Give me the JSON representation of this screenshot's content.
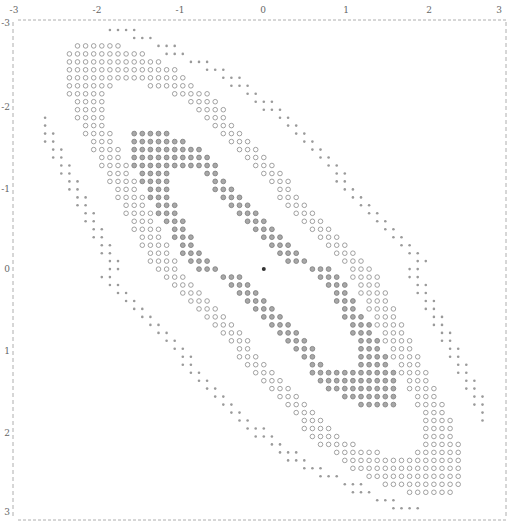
{
  "chart_data": {
    "type": "scatter",
    "title": "",
    "xlabel": "",
    "ylabel": "",
    "xlim": [
      -3,
      3
    ],
    "ylim": [
      -3,
      3
    ],
    "x_ticks": [
      "-3",
      "-2",
      "-1",
      "0",
      "1",
      "2",
      "3"
    ],
    "y_ticks": [
      "-3",
      "-2",
      "-1",
      "0",
      "1",
      "2",
      "3"
    ],
    "x_axis_position": "top",
    "y_axis_inverted": true,
    "grid": false,
    "frame": "dashed",
    "symmetry": "point-symmetric about (0,0)",
    "lattice": {
      "cols": 57,
      "rows": 61,
      "center_col": 28,
      "center_row": 30
    },
    "markers": {
      "dot": {
        "label": "small dot",
        "color": "#9a9a9a"
      },
      "ring": {
        "label": "hollow circle",
        "color": "#8a8a8a"
      },
      "filled": {
        "label": "filled circle",
        "color": "#7a7a7a"
      },
      "center": {
        "label": "center point",
        "color": "#333333"
      }
    },
    "rows_upper_half": [
      {
        "r": 0,
        "runs": [
          [
            "dot",
            9,
            12
          ]
        ]
      },
      {
        "r": 1,
        "runs": [
          [
            "dot",
            12,
            14
          ]
        ]
      },
      {
        "r": 2,
        "runs": [
          [
            "ring",
            5,
            10
          ],
          [
            "dot",
            15,
            17
          ]
        ]
      },
      {
        "r": 3,
        "runs": [
          [
            "ring",
            4,
            13
          ],
          [
            "dot",
            16,
            18
          ]
        ]
      },
      {
        "r": 4,
        "runs": [
          [
            "ring",
            4,
            15
          ],
          [
            "dot",
            19,
            21
          ]
        ]
      },
      {
        "r": 5,
        "runs": [
          [
            "ring",
            4,
            17
          ],
          [
            "dot",
            21,
            23
          ]
        ]
      },
      {
        "r": 6,
        "runs": [
          [
            "ring",
            4,
            18
          ],
          [
            "dot",
            23,
            25
          ]
        ]
      },
      {
        "r": 7,
        "runs": [
          [
            "ring",
            4,
            9
          ],
          [
            "ring",
            14,
            19
          ],
          [
            "dot",
            24,
            26
          ]
        ]
      },
      {
        "r": 8,
        "runs": [
          [
            "ring",
            4,
            8
          ],
          [
            "ring",
            17,
            21
          ],
          [
            "dot",
            26,
            27
          ]
        ]
      },
      {
        "r": 9,
        "runs": [
          [
            "ring",
            5,
            8
          ],
          [
            "ring",
            19,
            22
          ],
          [
            "dot",
            27,
            29
          ]
        ]
      },
      {
        "r": 10,
        "runs": [
          [
            "ring",
            5,
            8
          ],
          [
            "ring",
            20,
            23
          ],
          [
            "dot",
            28,
            30
          ]
        ]
      },
      {
        "r": 11,
        "runs": [
          [
            "ring",
            5,
            8
          ],
          [
            "dot",
            1,
            1
          ],
          [
            "ring",
            21,
            23
          ],
          [
            "dot",
            30,
            31
          ]
        ]
      },
      {
        "r": 12,
        "runs": [
          [
            "dot",
            1,
            1
          ],
          [
            "ring",
            6,
            8
          ],
          [
            "ring",
            22,
            24
          ],
          [
            "dot",
            31,
            32
          ]
        ]
      },
      {
        "r": 13,
        "runs": [
          [
            "dot",
            1,
            2
          ],
          [
            "ring",
            6,
            9
          ],
          [
            "filled",
            12,
            16
          ],
          [
            "ring",
            23,
            25
          ],
          [
            "dot",
            32,
            33
          ]
        ]
      },
      {
        "r": 14,
        "runs": [
          [
            "dot",
            1,
            2
          ],
          [
            "ring",
            7,
            9
          ],
          [
            "filled",
            12,
            18
          ],
          [
            "ring",
            24,
            26
          ],
          [
            "dot",
            33,
            34
          ]
        ]
      },
      {
        "r": 15,
        "runs": [
          [
            "dot",
            2,
            3
          ],
          [
            "ring",
            7,
            10
          ],
          [
            "filled",
            12,
            20
          ],
          [
            "ring",
            25,
            27
          ],
          [
            "dot",
            34,
            35
          ]
        ]
      },
      {
        "r": 16,
        "runs": [
          [
            "dot",
            2,
            3
          ],
          [
            "ring",
            8,
            10
          ],
          [
            "filled",
            12,
            21
          ],
          [
            "ring",
            26,
            28
          ],
          [
            "dot",
            35,
            36
          ]
        ]
      },
      {
        "r": 17,
        "runs": [
          [
            "dot",
            3,
            4
          ],
          [
            "ring",
            8,
            11
          ],
          [
            "filled",
            12,
            22
          ],
          [
            "ring",
            27,
            29
          ],
          [
            "dot",
            36,
            37
          ]
        ]
      },
      {
        "r": 18,
        "runs": [
          [
            "dot",
            3,
            4
          ],
          [
            "ring",
            9,
            11
          ],
          [
            "filled",
            13,
            16
          ],
          [
            "filled",
            21,
            22
          ],
          [
            "ring",
            28,
            30
          ],
          [
            "dot",
            37,
            38
          ]
        ]
      },
      {
        "r": 19,
        "runs": [
          [
            "dot",
            4,
            5
          ],
          [
            "ring",
            9,
            12
          ],
          [
            "filled",
            13,
            16
          ],
          [
            "filled",
            22,
            23
          ],
          [
            "ring",
            29,
            31
          ],
          [
            "dot",
            37,
            38
          ]
        ]
      },
      {
        "r": 20,
        "runs": [
          [
            "dot",
            4,
            5
          ],
          [
            "ring",
            10,
            12
          ],
          [
            "filled",
            14,
            16
          ],
          [
            "filled",
            22,
            24
          ],
          [
            "ring",
            30,
            31
          ],
          [
            "dot",
            38,
            39
          ]
        ]
      },
      {
        "r": 21,
        "runs": [
          [
            "dot",
            5,
            6
          ],
          [
            "ring",
            10,
            13
          ],
          [
            "filled",
            14,
            16
          ],
          [
            "filled",
            23,
            25
          ],
          [
            "ring",
            30,
            32
          ],
          [
            "dot",
            39,
            40
          ]
        ]
      },
      {
        "r": 22,
        "runs": [
          [
            "dot",
            5,
            6
          ],
          [
            "ring",
            11,
            13
          ],
          [
            "filled",
            15,
            17
          ],
          [
            "filled",
            24,
            26
          ],
          [
            "ring",
            31,
            33
          ],
          [
            "dot",
            40,
            41
          ]
        ]
      },
      {
        "r": 23,
        "runs": [
          [
            "dot",
            6,
            7
          ],
          [
            "ring",
            11,
            14
          ],
          [
            "filled",
            15,
            17
          ],
          [
            "filled",
            25,
            27
          ],
          [
            "ring",
            32,
            34
          ],
          [
            "dot",
            41,
            42
          ]
        ]
      },
      {
        "r": 24,
        "runs": [
          [
            "dot",
            6,
            7
          ],
          [
            "ring",
            12,
            14
          ],
          [
            "filled",
            16,
            18
          ],
          [
            "filled",
            26,
            28
          ],
          [
            "ring",
            33,
            35
          ],
          [
            "dot",
            42,
            43
          ]
        ]
      },
      {
        "r": 25,
        "runs": [
          [
            "dot",
            7,
            8
          ],
          [
            "ring",
            12,
            15
          ],
          [
            "filled",
            17,
            18
          ],
          [
            "filled",
            27,
            29
          ],
          [
            "ring",
            34,
            36
          ],
          [
            "dot",
            43,
            44
          ]
        ]
      },
      {
        "r": 26,
        "runs": [
          [
            "dot",
            7,
            8
          ],
          [
            "ring",
            13,
            15
          ],
          [
            "filled",
            17,
            19
          ],
          [
            "filled",
            28,
            30
          ],
          [
            "ring",
            35,
            37
          ],
          [
            "dot",
            44,
            45
          ]
        ]
      },
      {
        "r": 27,
        "runs": [
          [
            "dot",
            8,
            9
          ],
          [
            "ring",
            13,
            16
          ],
          [
            "filled",
            18,
            19
          ],
          [
            "filled",
            29,
            31
          ],
          [
            "ring",
            36,
            38
          ],
          [
            "dot",
            45,
            46
          ]
        ]
      },
      {
        "r": 28,
        "runs": [
          [
            "dot",
            8,
            9
          ],
          [
            "ring",
            14,
            16
          ],
          [
            "filled",
            18,
            20
          ],
          [
            "filled",
            30,
            32
          ],
          [
            "ring",
            37,
            39
          ],
          [
            "dot",
            46,
            47
          ]
        ]
      },
      {
        "r": 29,
        "runs": [
          [
            "dot",
            9,
            10
          ],
          [
            "ring",
            14,
            17
          ],
          [
            "filled",
            19,
            21
          ],
          [
            "filled",
            31,
            33
          ],
          [
            "ring",
            38,
            40
          ],
          [
            "dot",
            47,
            48
          ]
        ]
      },
      {
        "r": 30,
        "runs": [
          [
            "dot",
            9,
            10
          ],
          [
            "ring",
            15,
            17
          ],
          [
            "filled",
            20,
            22
          ],
          [
            "center",
            28,
            28
          ]
        ]
      }
    ]
  }
}
